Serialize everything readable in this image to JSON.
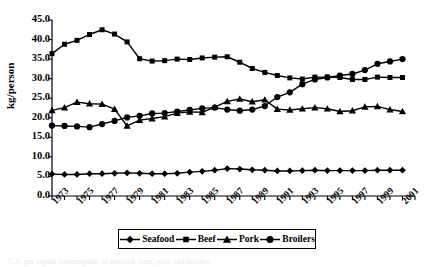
{
  "chart_data": {
    "type": "line",
    "title": "",
    "xlabel": "",
    "ylabel": "kg/person",
    "ylim": [
      0,
      45
    ],
    "ytick_step": 5,
    "ytick_labels": [
      "45.0",
      "40.0",
      "35.0",
      "30.0",
      "25.0",
      "20.0",
      "15.0",
      "10.0",
      "5.0",
      "0.0"
    ],
    "xlim": [
      1973,
      2002
    ],
    "x": [
      1973,
      1974,
      1975,
      1976,
      1977,
      1978,
      1979,
      1980,
      1981,
      1982,
      1983,
      1984,
      1985,
      1986,
      1987,
      1988,
      1989,
      1990,
      1991,
      1992,
      1993,
      1994,
      1995,
      1996,
      1997,
      1998,
      1999,
      2000,
      2001
    ],
    "xtick_labels": [
      "1973",
      "1975",
      "1977",
      "1979",
      "1981",
      "1983",
      "1985",
      "1987",
      "1989",
      "1991",
      "1993",
      "1995",
      "1997",
      "1999",
      "2001"
    ],
    "grid": false,
    "legend_position": "bottom-center",
    "series": [
      {
        "name": "Seafood",
        "marker": "diamond",
        "color": "#000000",
        "values": [
          5.6,
          5.5,
          5.5,
          5.7,
          5.7,
          5.8,
          5.9,
          5.8,
          5.7,
          5.7,
          5.8,
          6.1,
          6.3,
          6.6,
          7.0,
          6.9,
          6.7,
          6.6,
          6.4,
          6.4,
          6.5,
          6.6,
          6.5,
          6.5,
          6.5,
          6.5,
          6.6,
          6.6,
          6.6
        ]
      },
      {
        "name": "Beef",
        "marker": "square",
        "color": "#000000",
        "values": [
          36.4,
          38.8,
          39.8,
          41.3,
          42.5,
          41.4,
          39.4,
          35.1,
          34.5,
          34.6,
          35.0,
          34.9,
          35.3,
          35.5,
          35.6,
          34.2,
          32.6,
          31.6,
          30.8,
          30.2,
          29.9,
          30.4,
          30.4,
          30.3,
          29.8,
          29.8,
          30.4,
          30.3,
          30.3
        ]
      },
      {
        "name": "Pork",
        "marker": "triangle",
        "color": "#000000",
        "values": [
          21.9,
          22.6,
          24.0,
          23.6,
          23.5,
          22.2,
          17.9,
          19.4,
          19.8,
          20.3,
          21.2,
          21.5,
          21.4,
          22.7,
          24.2,
          24.8,
          24.1,
          24.6,
          22.2,
          22.0,
          22.3,
          22.6,
          22.3,
          21.6,
          21.8,
          22.8,
          22.9,
          22.1,
          21.6
        ]
      },
      {
        "name": "Broilers",
        "marker": "circle",
        "color": "#000000",
        "values": [
          18.0,
          17.9,
          17.8,
          17.6,
          18.4,
          19.2,
          20.1,
          20.5,
          21.1,
          21.2,
          21.6,
          22.0,
          22.4,
          22.6,
          22.1,
          21.8,
          22.1,
          23.0,
          25.3,
          26.5,
          28.6,
          29.8,
          30.3,
          30.8,
          31.2,
          32.2,
          33.8,
          34.4,
          35.0
        ]
      }
    ]
  },
  "legend": {
    "items": [
      {
        "label": "Seafood",
        "marker": "diamond"
      },
      {
        "label": "Beef",
        "marker": "square"
      },
      {
        "label": "Pork",
        "marker": "triangle"
      },
      {
        "label": "Broilers",
        "marker": "circle"
      }
    ]
  },
  "caption": {
    "text": "U.S. per capita consumption of seafood, beef, pork and broilers"
  }
}
